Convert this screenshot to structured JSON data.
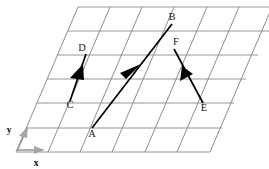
{
  "figure": {
    "type": "vector-diagram-on-oblique-grid",
    "background": "#ffffff",
    "grid": {
      "line_color": "#6f6f6f",
      "horizontal_line_color": "#8a8a8a",
      "rows": 6,
      "columns": 7,
      "origin": [
        16,
        152
      ],
      "bottom_right": [
        210,
        152
      ],
      "top_left": [
        78,
        7
      ],
      "skew_dx": 62,
      "height": 145
    },
    "axes": {
      "color": "#9a9a9a",
      "x": {
        "label": "x",
        "from": [
          17,
          150
        ],
        "to": [
          44,
          150
        ]
      },
      "y": {
        "label": "y",
        "from": [
          17,
          151
        ],
        "to": [
          28,
          126
        ]
      }
    },
    "points": [
      {
        "name": "A",
        "label": "A",
        "x": 92,
        "y": 128,
        "label_x": 92,
        "label_y": 137
      },
      {
        "name": "B",
        "label": "B",
        "x": 172,
        "y": 24,
        "label_x": 172,
        "label_y": 20
      },
      {
        "name": "C",
        "label": "C",
        "x": 70,
        "y": 101,
        "label_x": 70,
        "label_y": 108
      },
      {
        "name": "D",
        "label": "D",
        "x": 86,
        "y": 54,
        "label_x": 82,
        "label_y": 51
      },
      {
        "name": "E",
        "label": "E",
        "x": 203,
        "y": 103,
        "label_x": 204,
        "label_y": 111
      },
      {
        "name": "F",
        "label": "F",
        "x": 174,
        "y": 49,
        "label_x": 176,
        "label_y": 45
      }
    ],
    "vectors": [
      {
        "name": "AB",
        "from": "A",
        "to": "B",
        "color": "#000000",
        "head_at": "mid"
      },
      {
        "name": "CD",
        "from": "D",
        "to": "C",
        "color": "#000000",
        "head_at": "mid"
      },
      {
        "name": "EF",
        "from": "E",
        "to": "F",
        "color": "#000000",
        "head_at": "mid"
      }
    ]
  }
}
